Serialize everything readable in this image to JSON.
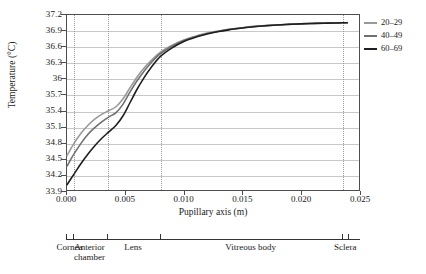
{
  "chart_data": {
    "type": "line",
    "title": "",
    "xlabel": "Pupillary axis (m)",
    "ylabel": "Temperature (°C)",
    "xlim": [
      0.0,
      0.025
    ],
    "ylim": [
      33.9,
      37.2
    ],
    "xticks": [
      "0.000",
      "0.005",
      "0.010",
      "0.015",
      "0.020",
      "0.025"
    ],
    "xtick_values": [
      0.0,
      0.005,
      0.01,
      0.015,
      0.02,
      0.025
    ],
    "yticks": [
      "37.2",
      "36.9",
      "36.6",
      "36.3",
      "36",
      "35.7",
      "35.4",
      "35.1",
      "34.8",
      "34.5",
      "34.2",
      "33.9"
    ],
    "ytick_values": [
      37.2,
      36.9,
      36.6,
      36.3,
      36.0,
      35.7,
      35.4,
      35.1,
      34.8,
      34.5,
      34.2,
      33.9
    ],
    "grid": "horizontal-solid-and-vertical-dotted",
    "legend_position": "right-top",
    "x": [
      0.0,
      0.0006,
      0.0012,
      0.0018,
      0.0024,
      0.003,
      0.0036,
      0.0042,
      0.0048,
      0.0054,
      0.006,
      0.0066,
      0.0072,
      0.008,
      0.009,
      0.01,
      0.011,
      0.012,
      0.013,
      0.014,
      0.015,
      0.016,
      0.017,
      0.018,
      0.019,
      0.02,
      0.021,
      0.022,
      0.023,
      0.0235,
      0.024
    ],
    "series": [
      {
        "name": "20–29",
        "color": "#999999",
        "values": [
          34.55,
          34.78,
          34.97,
          35.12,
          35.24,
          35.33,
          35.4,
          35.47,
          35.62,
          35.83,
          36.03,
          36.2,
          36.34,
          36.5,
          36.63,
          36.73,
          36.8,
          36.86,
          36.9,
          36.935,
          36.96,
          36.985,
          37.0,
          37.015,
          37.025,
          37.035,
          37.042,
          37.048,
          37.052,
          37.054,
          37.055
        ]
      },
      {
        "name": "40–49",
        "color": "#707070",
        "values": [
          34.35,
          34.58,
          34.78,
          34.95,
          35.08,
          35.19,
          35.28,
          35.36,
          35.52,
          35.75,
          35.96,
          36.14,
          36.3,
          36.47,
          36.61,
          36.72,
          36.79,
          36.85,
          36.895,
          36.93,
          36.958,
          36.983,
          37.0,
          37.013,
          37.024,
          37.034,
          37.041,
          37.047,
          37.051,
          37.053,
          37.055
        ]
      },
      {
        "name": "60–69",
        "color": "#1f1f1f",
        "values": [
          34.0,
          34.2,
          34.4,
          34.58,
          34.74,
          34.88,
          35.0,
          35.12,
          35.3,
          35.55,
          35.8,
          36.02,
          36.21,
          36.42,
          36.58,
          36.7,
          36.78,
          36.84,
          36.89,
          36.925,
          36.955,
          36.98,
          36.998,
          37.012,
          37.023,
          37.033,
          37.04,
          37.046,
          37.05,
          37.053,
          37.055
        ]
      }
    ],
    "region_boundaries": [
      0.0,
      0.0006,
      0.0035,
      0.008,
      0.0235,
      0.024
    ],
    "vertical_gridline_values": [
      0.0006,
      0.0035,
      0.008,
      0.0235
    ],
    "regions": [
      {
        "label": "Cornea",
        "center": 0.0003
      },
      {
        "label": "Anterior\nchamber",
        "center": 0.002
      },
      {
        "label": "Lens",
        "center": 0.0057
      },
      {
        "label": "Vitreous body",
        "center": 0.0157
      },
      {
        "label": "Sclera",
        "center": 0.02375
      }
    ]
  }
}
